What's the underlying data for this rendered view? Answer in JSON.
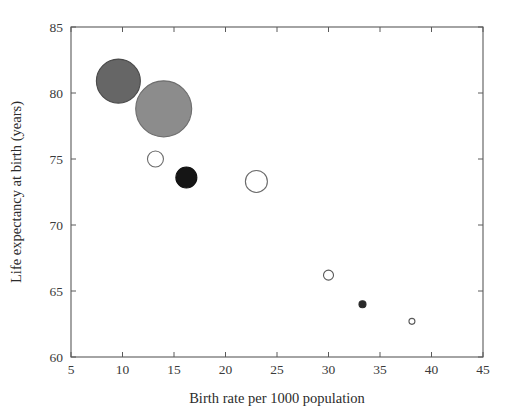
{
  "chart_data": {
    "type": "scatter",
    "title": "",
    "xlabel": "Birth rate per 1000 population",
    "ylabel": "Life expectancy at birth (years)",
    "xlim": [
      5,
      45
    ],
    "ylim": [
      60,
      85
    ],
    "xticks": [
      5,
      10,
      15,
      20,
      25,
      30,
      35,
      40,
      45
    ],
    "xticklabels": [
      "5",
      "10",
      "15",
      "20",
      "25",
      "30",
      "35",
      "40",
      "45"
    ],
    "yticks": [
      60,
      65,
      70,
      75,
      80,
      85
    ],
    "yticklabels": [
      "60",
      "65",
      "70",
      "75",
      "80",
      "85"
    ],
    "grid": false,
    "legend": false,
    "marker_shape": "circle",
    "size_encodes": "population",
    "points": [
      {
        "x": 9.6,
        "y": 80.9,
        "r_px": 22.0,
        "fill": "#666666",
        "stroke": "#4a4a4a"
      },
      {
        "x": 14.0,
        "y": 78.8,
        "r_px": 28.0,
        "fill": "#8c8c8c",
        "stroke": "#6e6e6e"
      },
      {
        "x": 13.2,
        "y": 75.0,
        "r_px": 8.0,
        "fill": "#ffffff",
        "stroke": "#6b6b6b"
      },
      {
        "x": 16.2,
        "y": 73.6,
        "r_px": 10.5,
        "fill": "#151515",
        "stroke": "#101010"
      },
      {
        "x": 23.0,
        "y": 73.3,
        "r_px": 11.0,
        "fill": "#ffffff",
        "stroke": "#6b6b6b"
      },
      {
        "x": 30.0,
        "y": 66.2,
        "r_px": 5.0,
        "fill": "#ffffff",
        "stroke": "#5a5a5a"
      },
      {
        "x": 33.3,
        "y": 64.0,
        "r_px": 3.5,
        "fill": "#2a2a2a",
        "stroke": "#2a2a2a"
      },
      {
        "x": 38.1,
        "y": 62.7,
        "r_px": 3.0,
        "fill": "#ffffff",
        "stroke": "#5a5a5a"
      }
    ]
  },
  "figure": {
    "background_color": "#ffffff",
    "axis_color": "#5a5a5a",
    "text_color": "#2b2b2b"
  }
}
